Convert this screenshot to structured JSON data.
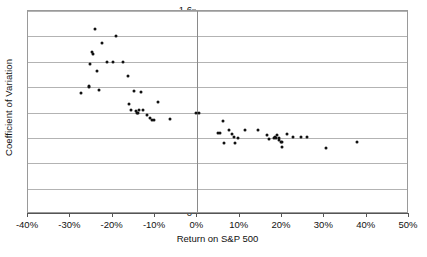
{
  "chart_data": {
    "type": "scatter",
    "title": "",
    "xlabel": "Return on S&P 500",
    "ylabel": "Coefficient of Variation",
    "xlim": [
      -40,
      50
    ],
    "ylim": [
      0,
      1.6
    ],
    "xtick_labels": [
      "-40%",
      "-30%",
      "-20%",
      "-10%",
      "0%",
      "10%",
      "20%",
      "30%",
      "40%",
      "50%"
    ],
    "xtick_values": [
      -40,
      -30,
      -20,
      -10,
      0,
      10,
      20,
      30,
      40,
      50
    ],
    "ytick_labels": [
      "0",
      "0.2",
      "0.4",
      "0.6",
      "0.8",
      "1",
      "1.2",
      "1.4",
      "1.6"
    ],
    "ytick_values": [
      0,
      0.2,
      0.4,
      0.6,
      0.8,
      1,
      1.2,
      1.4,
      1.6
    ],
    "grid": "horizontal",
    "legend": "none",
    "marker": "filled-circle",
    "marker_color": "#111111",
    "series": [
      {
        "name": "Observations",
        "points": [
          [
            -27.5,
            0.95
          ],
          [
            -25.6,
            1.0
          ],
          [
            -25.5,
            1.01
          ],
          [
            -25.4,
            1.18
          ],
          [
            -24.7,
            1.26
          ],
          [
            -24.8,
            1.28
          ],
          [
            -24.2,
            1.46
          ],
          [
            -23.6,
            1.13
          ],
          [
            -23.3,
            0.98
          ],
          [
            -22.5,
            1.35
          ],
          [
            -21.4,
            1.2
          ],
          [
            -19.9,
            1.2
          ],
          [
            -19.3,
            1.4
          ],
          [
            -17.6,
            1.2
          ],
          [
            -16.4,
            1.09
          ],
          [
            -16.1,
            0.87
          ],
          [
            -15.7,
            0.82
          ],
          [
            -15.0,
            0.97
          ],
          [
            -14.6,
            0.81
          ],
          [
            -14.2,
            0.8
          ],
          [
            -13.9,
            0.8
          ],
          [
            -13.7,
            0.82
          ],
          [
            -13.3,
            0.96
          ],
          [
            -12.8,
            0.82
          ],
          [
            -11.9,
            0.78
          ],
          [
            -11.2,
            0.76
          ],
          [
            -10.6,
            0.74
          ],
          [
            -10.3,
            0.74
          ],
          [
            -9.2,
            0.88
          ],
          [
            -6.5,
            0.75
          ],
          [
            -0.3,
            0.8
          ],
          [
            0.3,
            0.8
          ],
          [
            4.8,
            0.64
          ],
          [
            5.3,
            0.64
          ],
          [
            6.0,
            0.73
          ],
          [
            6.4,
            0.56
          ],
          [
            7.4,
            0.66
          ],
          [
            8.2,
            0.63
          ],
          [
            8.6,
            0.61
          ],
          [
            8.8,
            0.56
          ],
          [
            9.5,
            0.6
          ],
          [
            11.2,
            0.66
          ],
          [
            14.3,
            0.66
          ],
          [
            16.5,
            0.62
          ],
          [
            16.9,
            0.59
          ],
          [
            18.0,
            0.6
          ],
          [
            18.4,
            0.61
          ],
          [
            18.6,
            0.6
          ],
          [
            18.9,
            0.62
          ],
          [
            19.2,
            0.6
          ],
          [
            19.4,
            0.58
          ],
          [
            19.7,
            0.57
          ],
          [
            20.0,
            0.57
          ],
          [
            19.9,
            0.53
          ],
          [
            21.2,
            0.63
          ],
          [
            22.6,
            0.61
          ],
          [
            24.6,
            0.61
          ],
          [
            25.8,
            0.61
          ],
          [
            30.5,
            0.52
          ],
          [
            37.8,
            0.57
          ]
        ]
      }
    ]
  }
}
